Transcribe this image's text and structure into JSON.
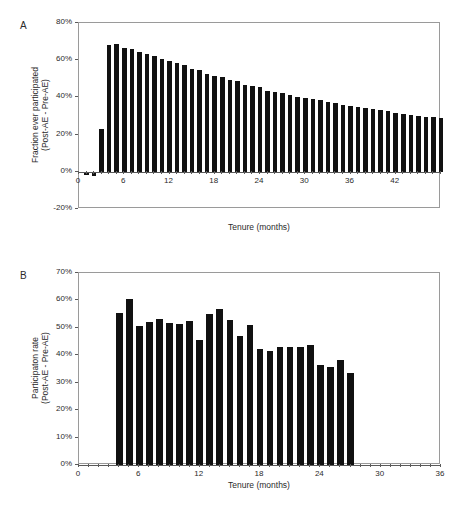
{
  "figure": {
    "background": "#ffffff",
    "bar_color": "#111111",
    "axis_color": "#5a5a5a",
    "frame_color": "#9a9a9a"
  },
  "panels": [
    {
      "letter": "A",
      "xlabel": "Tenure (months)",
      "ylabel_line1": "Fraction ever participated",
      "ylabel_line2": "(Post-AE - Pre-AE)",
      "ytick_labels": [
        "80%",
        "60%",
        "40%",
        "20%",
        "0%",
        "-20%"
      ],
      "xtick_labels": [
        "0",
        "6",
        "12",
        "18",
        "24",
        "30",
        "36",
        "42"
      ]
    },
    {
      "letter": "B",
      "xlabel": "Tenure (months)",
      "ylabel_line1": "Participaton rate",
      "ylabel_line2": "(Post-AE - Pre-AE)",
      "ytick_labels": [
        "70%",
        "60%",
        "50%",
        "40%",
        "30%",
        "20%",
        "10%",
        "0%"
      ],
      "xtick_labels": [
        "0",
        "6",
        "12",
        "18",
        "24",
        "30",
        "36"
      ]
    }
  ],
  "chart_data": [
    {
      "type": "bar",
      "panel": "A",
      "title": "",
      "xlabel": "Tenure (months)",
      "ylabel": "Fraction ever participated (Post-AE - Pre-AE)",
      "xlim": [
        0,
        48
      ],
      "ylim": [
        -0.2,
        0.8
      ],
      "ytick_values": [
        0.8,
        0.6,
        0.4,
        0.2,
        0.0,
        -0.2
      ],
      "ytick_labels": [
        "80%",
        "60%",
        "40%",
        "20%",
        "0%",
        "-20%"
      ],
      "xtick_values": [
        0,
        6,
        12,
        18,
        24,
        30,
        36,
        42
      ],
      "xtick_labels": [
        "0",
        "6",
        "12",
        "18",
        "24",
        "30",
        "36",
        "42"
      ],
      "grid": false,
      "legend": null,
      "x": [
        1,
        2,
        3,
        4,
        5,
        6,
        7,
        8,
        9,
        10,
        11,
        12,
        13,
        14,
        15,
        16,
        17,
        18,
        19,
        20,
        21,
        22,
        23,
        24,
        25,
        26,
        27,
        28,
        29,
        30,
        31,
        32,
        33,
        34,
        35,
        36,
        37,
        38,
        39,
        40,
        41,
        42,
        43,
        44,
        45,
        46,
        47,
        48
      ],
      "values": [
        -0.018,
        -0.022,
        0.232,
        0.681,
        0.686,
        0.667,
        0.66,
        0.645,
        0.633,
        0.625,
        0.608,
        0.596,
        0.583,
        0.573,
        0.552,
        0.545,
        0.525,
        0.515,
        0.51,
        0.493,
        0.486,
        0.466,
        0.459,
        0.454,
        0.437,
        0.431,
        0.424,
        0.411,
        0.403,
        0.396,
        0.39,
        0.385,
        0.374,
        0.368,
        0.361,
        0.355,
        0.349,
        0.345,
        0.339,
        0.331,
        0.326,
        0.318,
        0.311,
        0.305,
        0.3,
        0.296,
        0.292,
        0.288
      ]
    },
    {
      "type": "bar",
      "panel": "B",
      "title": "",
      "xlabel": "Tenure (months)",
      "ylabel": "Participaton rate (Post-AE - Pre-AE)",
      "xlim": [
        0,
        36
      ],
      "ylim": [
        0,
        0.7
      ],
      "ytick_values": [
        0.7,
        0.6,
        0.5,
        0.4,
        0.3,
        0.2,
        0.1,
        0.0
      ],
      "ytick_labels": [
        "70%",
        "60%",
        "50%",
        "40%",
        "30%",
        "20%",
        "10%",
        "0%"
      ],
      "xtick_values": [
        0,
        6,
        12,
        18,
        24,
        30,
        36
      ],
      "xtick_labels": [
        "0",
        "6",
        "12",
        "18",
        "24",
        "30",
        "36"
      ],
      "grid": false,
      "legend": null,
      "x": [
        4,
        5,
        6,
        7,
        8,
        9,
        10,
        11,
        12,
        13,
        14,
        15,
        16,
        17,
        18,
        19,
        20,
        21,
        22,
        23,
        24,
        25,
        26,
        27
      ],
      "values": [
        0.554,
        0.606,
        0.506,
        0.521,
        0.531,
        0.516,
        0.514,
        0.525,
        0.455,
        0.549,
        0.57,
        0.528,
        0.469,
        0.512,
        0.423,
        0.415,
        0.432,
        0.43,
        0.429,
        0.439,
        0.365,
        0.356,
        0.382,
        0.334
      ]
    }
  ]
}
